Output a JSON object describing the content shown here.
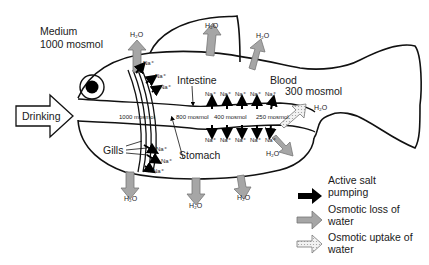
{
  "medium": {
    "label": "Medium",
    "osmolarity": "1000 mosmol"
  },
  "blood": {
    "label": "Blood",
    "osmolarity": "300 mosmol"
  },
  "drinking": {
    "label": "Drinking"
  },
  "organs": {
    "intestine": "Intestine",
    "stomach": "Stomach",
    "gills": "Gills"
  },
  "gradient": {
    "stomach_entry": "1000 mosmol",
    "stomach": "800 mosmol",
    "intestine_mid": "400 mosmol",
    "intestine_end": "250 mosmol"
  },
  "ions": {
    "sodium": "Na⁺"
  },
  "water": {
    "formula": "H₂O"
  },
  "legend": {
    "items": [
      {
        "label_line1": "Active salt",
        "label_line2": "pumping",
        "icon": "black-arrow",
        "color": "#000000"
      },
      {
        "label_line1": "Osmotic loss of",
        "label_line2": "water",
        "icon": "gray-arrow",
        "color": "#a6a6a6"
      },
      {
        "label_line1": "Osmotic uptake of",
        "label_line2": "water",
        "icon": "dotted-arrow",
        "color": "#e6e6e6"
      }
    ]
  }
}
